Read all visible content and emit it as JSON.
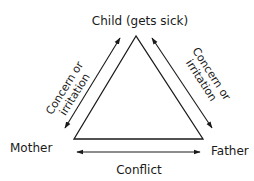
{
  "diagram": {
    "type": "family-triangle",
    "nodes": {
      "top": {
        "label": "Child (gets sick)"
      },
      "left": {
        "label": "Mother"
      },
      "right": {
        "label": "Father"
      }
    },
    "edges": {
      "left": {
        "label_line1": "Concern or",
        "label_line2": "irritation",
        "direction": "bidirectional"
      },
      "right": {
        "label_line1": "Concern or",
        "label_line2": "irritation",
        "direction": "bidirectional"
      },
      "bottom": {
        "label": "Conflict",
        "direction": "bidirectional"
      }
    },
    "colors": {
      "line": "#1a1a1a",
      "text": "#1a1a1a",
      "background": "#ffffff"
    }
  }
}
